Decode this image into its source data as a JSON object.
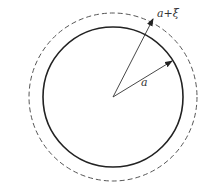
{
  "diagram": {
    "center": {
      "x": 113,
      "y": 97
    },
    "inner_circle": {
      "radius": 70,
      "style": "solid",
      "color": "#222222"
    },
    "outer_circle": {
      "radius": 84,
      "style": "dashed",
      "color": "#555555"
    },
    "labels": {
      "inner_radius": "a",
      "outer_radius": "a+ξ"
    },
    "arrows": [
      {
        "name": "inner-radius-arrow",
        "to": {
          "x": 172,
          "y": 61
        }
      },
      {
        "name": "outer-radius-arrow",
        "to": {
          "x": 153,
          "y": 19
        }
      }
    ]
  }
}
